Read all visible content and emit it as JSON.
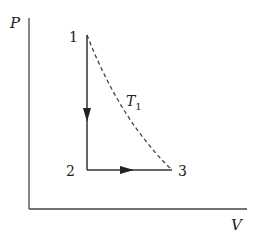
{
  "diagram": {
    "type": "PV diagram",
    "axes": {
      "y_label": "P",
      "x_label": "V"
    },
    "points": [
      {
        "id": "1",
        "label": "1"
      },
      {
        "id": "2",
        "label": "2"
      },
      {
        "id": "3",
        "label": "3"
      }
    ],
    "processes": [
      {
        "from": "1",
        "to": "2",
        "style": "solid",
        "direction": "down",
        "description": "isochoric"
      },
      {
        "from": "2",
        "to": "3",
        "style": "solid",
        "direction": "right",
        "description": "isobaric"
      },
      {
        "from": "1",
        "to": "3",
        "style": "dashed",
        "description": "isotherm"
      }
    ],
    "isotherm_label": {
      "main": "T",
      "subscript": "1"
    },
    "colors": {
      "line": "#333333",
      "background": "#ffffff"
    }
  }
}
